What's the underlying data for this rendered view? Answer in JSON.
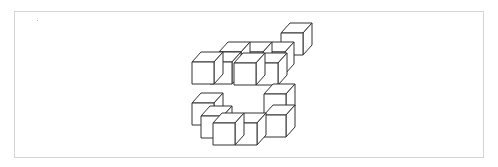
{
  "figure": {
    "type": "isometric-cube-stack",
    "cube_size": 22,
    "depth_offset": [
      9,
      -10
    ],
    "stroke_color": "#333333",
    "fill_color": "#ffffff",
    "frame_color": "#d4d4d4",
    "cubes": [
      {
        "x": 281,
        "y": 33
      },
      {
        "x": 219,
        "y": 52
      },
      {
        "x": 241,
        "y": 52
      },
      {
        "x": 263,
        "y": 52
      },
      {
        "x": 210,
        "y": 62
      },
      {
        "x": 234,
        "y": 63
      },
      {
        "x": 256,
        "y": 63
      },
      {
        "x": 192,
        "y": 62
      },
      {
        "x": 201,
        "y": 116
      },
      {
        "x": 264,
        "y": 94
      },
      {
        "x": 192,
        "y": 103
      },
      {
        "x": 264,
        "y": 115
      },
      {
        "x": 213,
        "y": 123
      },
      {
        "x": 235,
        "y": 123
      }
    ]
  }
}
